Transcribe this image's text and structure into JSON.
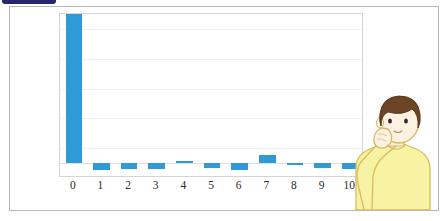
{
  "page": {
    "background_color": "#ffffff",
    "panel_border_color": "#b9b9b9",
    "top_strip_color": "#27286b",
    "top_strip_name": "cut-off-title-bar"
  },
  "chart_data": {
    "type": "bar",
    "title": "",
    "xlabel": "",
    "ylabel": "",
    "categories": [
      "0",
      "1",
      "2",
      "3",
      "4",
      "5",
      "6",
      "7",
      "8",
      "9",
      "10"
    ],
    "values": [
      1.0,
      -0.045,
      -0.042,
      -0.043,
      0.0,
      -0.032,
      -0.045,
      0.055,
      -0.004,
      -0.035,
      -0.042
    ],
    "ylim": [
      -0.1,
      1.0
    ],
    "yticks": [
      "0.9",
      "0.7",
      "0.5",
      "0.3",
      "0.1",
      "0",
      "-0.1"
    ],
    "ytick_values": [
      0.9,
      0.7,
      0.5,
      0.3,
      0.1,
      0,
      -0.1
    ],
    "xticks": [
      "0",
      "1",
      "2",
      "3",
      "4",
      "5",
      "6",
      "7",
      "8",
      "9",
      "10"
    ],
    "bar_color": "#2e9bd8",
    "grid": true,
    "grid_color": "#f0f0f2",
    "legend": "none",
    "plot_border_color": "#d6d2d6"
  },
  "illustration": {
    "name": "thinking-person",
    "description": "cartoon person in yellow shirt with hand to chin",
    "shirt_color": "#f7f0a0",
    "hair_color": "#6b4526",
    "skin_color": "#fdf1e2",
    "outline_color": "#d8b96a"
  }
}
